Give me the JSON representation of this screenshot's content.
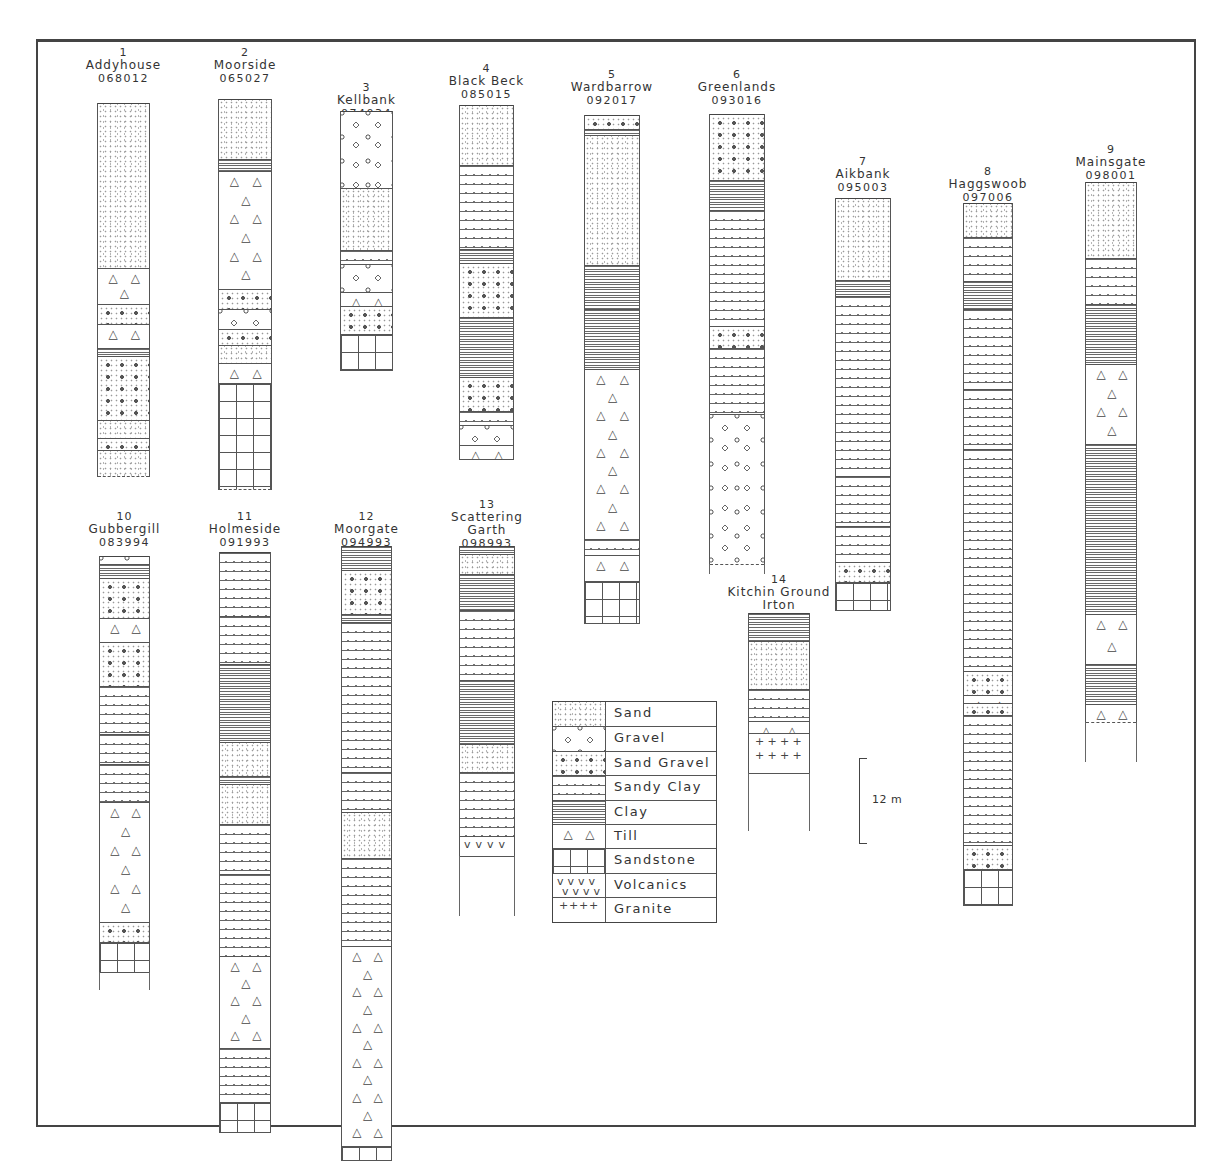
{
  "figure": {
    "scale_bar": {
      "label": "12 m",
      "meters": 12
    },
    "legend_title": "",
    "legend": [
      {
        "key": "sand",
        "label": "Sand"
      },
      {
        "key": "gravel",
        "label": "Gravel"
      },
      {
        "key": "sandgravel",
        "label": "Sand Gravel"
      },
      {
        "key": "sandyclay",
        "label": "Sandy Clay"
      },
      {
        "key": "clay",
        "label": "Clay"
      },
      {
        "key": "till",
        "label": "Till"
      },
      {
        "key": "sandstone",
        "label": "Sandstone"
      },
      {
        "key": "volcanics",
        "label": "Volcanics"
      },
      {
        "key": "granite",
        "label": "Granite"
      }
    ]
  },
  "boreholes": [
    {
      "num": "1",
      "name": "Addyhouse",
      "ref": "068012"
    },
    {
      "num": "2",
      "name": "Moorside",
      "ref": "065027"
    },
    {
      "num": "3",
      "name": "Kellbank",
      "ref": "074034"
    },
    {
      "num": "4",
      "name": "Black Beck",
      "ref": "085015"
    },
    {
      "num": "5",
      "name": "Wardbarrow",
      "ref": "092017"
    },
    {
      "num": "6",
      "name": "Greenlands",
      "ref": "093016"
    },
    {
      "num": "7",
      "name": "Aikbank",
      "ref": "095003"
    },
    {
      "num": "8",
      "name": "Haggswoob",
      "ref": "097006"
    },
    {
      "num": "9",
      "name": "Mainsgate",
      "ref": "098001"
    },
    {
      "num": "10",
      "name": "Gubbergill",
      "ref": "083994"
    },
    {
      "num": "11",
      "name": "Holmeside",
      "ref": "091993"
    },
    {
      "num": "12",
      "name": "Moorgate",
      "ref": "094993"
    },
    {
      "num": "13",
      "name": "Scattering Garth",
      "ref": "098993"
    },
    {
      "num": "14",
      "name": "Kitchin Ground Irton",
      "ref": ""
    }
  ],
  "layout": {
    "columns": [
      {
        "x": 97,
        "w": 53,
        "hdrTop": 46,
        "top": 103,
        "tail": 0,
        "dashEnd": true,
        "layers": [
          [
            "sand",
            165
          ],
          [
            "till",
            36
          ],
          [
            "sandgravel",
            20
          ],
          [
            "till",
            24
          ],
          [
            "clay",
            8
          ],
          [
            "sandgravel",
            64
          ],
          [
            "sand",
            18
          ],
          [
            "sandgravel",
            12
          ],
          [
            "sand",
            26
          ]
        ]
      },
      {
        "x": 218,
        "w": 54,
        "hdrTop": 46,
        "top": 99,
        "tail": 0,
        "dashEnd": true,
        "layers": [
          [
            "sand",
            60
          ],
          [
            "clay",
            12
          ],
          [
            "till",
            118
          ],
          [
            "sandgravel",
            20
          ],
          [
            "gravel",
            20
          ],
          [
            "sandgravel",
            16
          ],
          [
            "sand",
            18
          ],
          [
            "till",
            20
          ],
          [
            "sandstone",
            106
          ]
        ]
      },
      {
        "x": 340,
        "w": 53,
        "hdrTop": 81,
        "top": 111,
        "tail": 0,
        "dashEnd": false,
        "layers": [
          [
            "gravel",
            77
          ],
          [
            "sand",
            62
          ],
          [
            "sandyclay",
            14
          ],
          [
            "gravel",
            28
          ],
          [
            "till",
            14
          ],
          [
            "sandgravel",
            28
          ],
          [
            "sandstone",
            36
          ]
        ]
      },
      {
        "x": 459,
        "w": 55,
        "hdrTop": 62,
        "top": 105,
        "tail": 0,
        "dashEnd": false,
        "layers": [
          [
            "sand",
            60
          ],
          [
            "sandyclay",
            84
          ],
          [
            "clay",
            14
          ],
          [
            "sandgravel",
            54
          ],
          [
            "clay",
            60
          ],
          [
            "sandgravel",
            34
          ],
          [
            "sandyclay",
            14
          ],
          [
            "gravel",
            20
          ],
          [
            "till",
            14
          ]
        ]
      },
      {
        "x": 584,
        "w": 56,
        "hdrTop": 68,
        "top": 115,
        "tail": 0,
        "dashEnd": false,
        "layers": [
          [
            "sandgravel",
            14
          ],
          [
            "clay",
            6
          ],
          [
            "sand",
            130
          ],
          [
            "clay",
            44
          ],
          [
            "clay",
            60
          ],
          [
            "till",
            170
          ],
          [
            "sandyclay",
            16
          ],
          [
            "till",
            26
          ],
          [
            "sandstone",
            42
          ]
        ]
      },
      {
        "x": 709,
        "w": 56,
        "hdrTop": 68,
        "top": 114,
        "tail": 10,
        "dashEnd": true,
        "layers": [
          [
            "sandgravel",
            66
          ],
          [
            "clay",
            30
          ],
          [
            "sandyclay",
            116
          ],
          [
            "sandgravel",
            22
          ],
          [
            "sandyclay",
            66
          ],
          [
            "gravel",
            150
          ]
        ]
      },
      {
        "x": 835,
        "w": 56,
        "hdrTop": 155,
        "top": 198,
        "tail": 0,
        "dashEnd": false,
        "layers": [
          [
            "sand",
            82
          ],
          [
            "clay",
            16
          ],
          [
            "sandyclay",
            180
          ],
          [
            "sandyclay",
            50
          ],
          [
            "sandyclay",
            36
          ],
          [
            "sandgravel",
            20
          ],
          [
            "sandstone",
            28
          ]
        ]
      },
      {
        "x": 963,
        "w": 50,
        "hdrTop": 165,
        "top": 203,
        "tail": 0,
        "dashEnd": false,
        "layers": [
          [
            "sand",
            34
          ],
          [
            "sandyclay",
            44
          ],
          [
            "clay",
            28
          ],
          [
            "sandyclay",
            80
          ],
          [
            "sandyclay",
            60
          ],
          [
            "sandyclay",
            222
          ],
          [
            "sandgravel",
            24
          ],
          [
            "till",
            8
          ],
          [
            "sandgravel",
            12
          ],
          [
            "sandyclay",
            130
          ],
          [
            "sandgravel",
            24
          ],
          [
            "sandstone",
            36
          ]
        ]
      },
      {
        "x": 1085,
        "w": 52,
        "hdrTop": 143,
        "top": 182,
        "tail": 40,
        "dashEnd": true,
        "layers": [
          [
            "sand",
            76
          ],
          [
            "sandyclay",
            46
          ],
          [
            "clay",
            60
          ],
          [
            "till",
            80
          ],
          [
            "clay",
            170
          ],
          [
            "till",
            50
          ],
          [
            "clay",
            40
          ],
          [
            "till",
            18
          ]
        ]
      },
      {
        "x": 99,
        "w": 51,
        "hdrTop": 510,
        "top": 556,
        "tail": 18,
        "dashEnd": false,
        "layers": [
          [
            "gravel",
            8
          ],
          [
            "clay",
            14
          ],
          [
            "sandgravel",
            40
          ],
          [
            "till",
            24
          ],
          [
            "sandgravel",
            44
          ],
          [
            "sandyclay",
            48
          ],
          [
            "sandyclay",
            30
          ],
          [
            "sandyclay",
            38
          ],
          [
            "till",
            120
          ],
          [
            "sandgravel",
            20
          ],
          [
            "sandstone",
            30
          ]
        ]
      },
      {
        "x": 219,
        "w": 52,
        "hdrTop": 510,
        "top": 552,
        "tail": 0,
        "dashEnd": false,
        "layers": [
          [
            "sandyclay",
            64
          ],
          [
            "sandyclay",
            48
          ],
          [
            "clay",
            78
          ],
          [
            "sand",
            34
          ],
          [
            "clay",
            8
          ],
          [
            "sand",
            40
          ],
          [
            "sandyclay",
            50
          ],
          [
            "sandyclay",
            82
          ],
          [
            "till",
            92
          ],
          [
            "sandyclay",
            54
          ],
          [
            "sandstone",
            30
          ]
        ]
      },
      {
        "x": 341,
        "w": 51,
        "hdrTop": 510,
        "top": 546,
        "tail": 0,
        "dashEnd": false,
        "layers": [
          [
            "clay",
            24
          ],
          [
            "sandgravel",
            44
          ],
          [
            "clay",
            8
          ],
          [
            "sandyclay",
            150
          ],
          [
            "sandyclay",
            40
          ],
          [
            "sand",
            46
          ],
          [
            "sandyclay",
            88
          ],
          [
            "till",
            200
          ],
          [
            "sandstone",
            14
          ]
        ]
      },
      {
        "x": 459,
        "w": 56,
        "hdrTop": 498,
        "top": 546,
        "tail": 60,
        "dashEnd": false,
        "layers": [
          [
            "clay",
            8
          ],
          [
            "sand",
            20
          ],
          [
            "clay",
            36
          ],
          [
            "sandyclay",
            70
          ],
          [
            "clay",
            64
          ],
          [
            "sand",
            28
          ],
          [
            "sandyclay",
            64
          ],
          [
            "volcanics",
            20
          ]
        ]
      },
      {
        "x": 748,
        "w": 62,
        "hdrTop": 573,
        "top": 613,
        "tail": 58,
        "dashEnd": false,
        "layers": [
          [
            "clay",
            28
          ],
          [
            "sand",
            48
          ],
          [
            "sandyclay",
            32
          ],
          [
            "till",
            12
          ],
          [
            "granite",
            40
          ]
        ]
      }
    ]
  }
}
